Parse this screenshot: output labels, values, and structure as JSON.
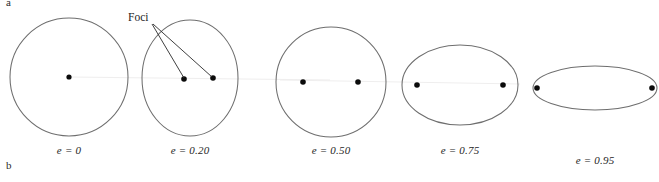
{
  "figure": {
    "panel_letters": [
      {
        "label": "a",
        "position": "top-left"
      },
      {
        "label": "b",
        "position": "bottom-left"
      }
    ],
    "annotation": {
      "foci_label": "Foci"
    },
    "orbits": [
      {
        "name": "circle-e0",
        "eccentricity_label": "e = 0",
        "eccentricity_value": 0,
        "cx": 69,
        "cy": 77,
        "rx": 59,
        "ry": 59,
        "foci": [
          {
            "x": 69,
            "y": 77
          }
        ],
        "label_x": 69,
        "label_y": 150
      },
      {
        "name": "ellipse-e020",
        "eccentricity_label": "e = 0.20",
        "eccentricity_value": 0.2,
        "cx": 190,
        "cy": 78,
        "rx": 48,
        "ry": 58,
        "foci": [
          {
            "x": 184,
            "y": 79
          },
          {
            "x": 213,
            "y": 78
          }
        ],
        "label_x": 190,
        "label_y": 150
      },
      {
        "name": "ellipse-e050",
        "eccentricity_label": "e = 0.50",
        "eccentricity_value": 0.5,
        "cx": 331,
        "cy": 82,
        "rx": 55,
        "ry": 55,
        "foci": [
          {
            "x": 303,
            "y": 82
          },
          {
            "x": 358,
            "y": 82
          }
        ],
        "label_x": 331,
        "label_y": 150
      },
      {
        "name": "ellipse-e075",
        "eccentricity_label": "e = 0.75",
        "eccentricity_value": 0.75,
        "cx": 460,
        "cy": 85,
        "rx": 58,
        "ry": 40,
        "foci": [
          {
            "x": 417,
            "y": 85
          },
          {
            "x": 503,
            "y": 85
          }
        ],
        "label_x": 460,
        "label_y": 150
      },
      {
        "name": "ellipse-e095",
        "eccentricity_label": "e = 0.95",
        "eccentricity_value": 0.95,
        "cx": 595,
        "cy": 88,
        "rx": 62,
        "ry": 22,
        "foci": [
          {
            "x": 537,
            "y": 88
          },
          {
            "x": 652,
            "y": 88
          }
        ],
        "label_x": 595,
        "label_y": 160
      }
    ],
    "leader_lines": [
      {
        "x1": 152,
        "y1": 24,
        "x2": 184,
        "y2": 78
      },
      {
        "x1": 153,
        "y1": 24,
        "x2": 212,
        "y2": 77
      }
    ],
    "colors": {
      "orbit_stroke": "#6e6e6e",
      "focus_dot": "#0b0b0b",
      "text": "#262626",
      "background": "#ffffff"
    }
  }
}
